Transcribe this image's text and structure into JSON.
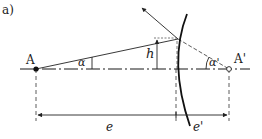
{
  "figure": {
    "panel_label": "a)",
    "points": {
      "object_label": "A",
      "image_label": "A'"
    },
    "angles": {
      "object_angle": "α",
      "image_angle": "α'"
    },
    "height_label": "h",
    "distances": {
      "object_distance": "e",
      "image_distance": "e'"
    },
    "colors": {
      "line": "#222222",
      "axis": "#555555",
      "background": "#ffffff"
    }
  }
}
